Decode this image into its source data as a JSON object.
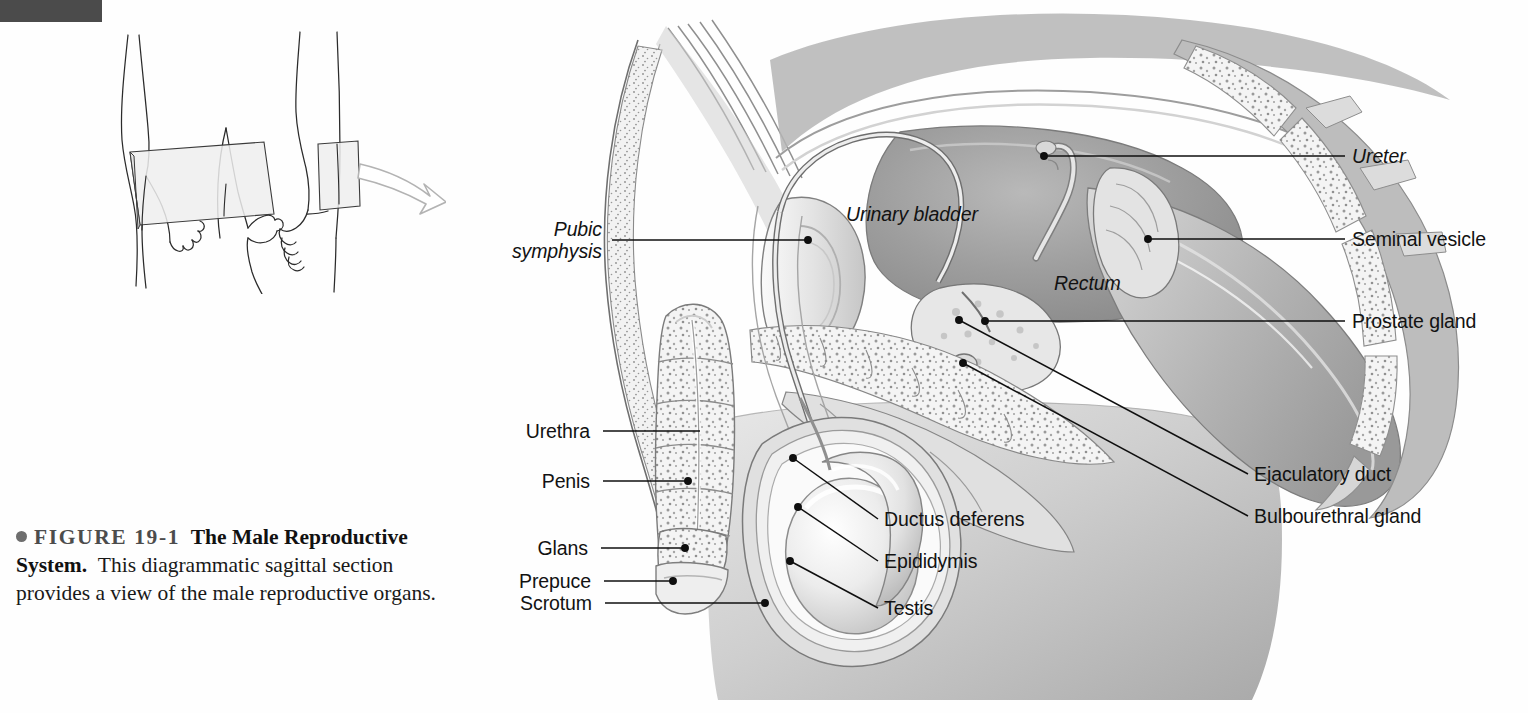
{
  "figure": {
    "tab_color": "#4b4b4b",
    "caption": {
      "bullet": "bullet-icon",
      "figure_number": "FIGURE 19-1",
      "title": "The Male Reproductive System.",
      "body": "This diagrammatic sagittal section provides a view of the male reproductive organs."
    }
  },
  "inset": {
    "name": "orientation-inset",
    "description": "line drawing of a standing figure with sagittal section planes and a curved arrow",
    "arrow_color": "#b0b0b0",
    "plane_fill": "#f0f0f0",
    "line_color": "#2b2b2b"
  },
  "illustration": {
    "name": "male-reproductive-sagittal-section",
    "style": "grayscale medical airbrush illustration"
  },
  "labels": {
    "left": [
      {
        "id": "pubic-symphysis",
        "text": "Pubic",
        "text2": "symphysis",
        "italic": true,
        "x": 518,
        "y": 228,
        "lead_x1": 612,
        "lead_y1": 240,
        "lead_x2": 808,
        "lead_y2": 240
      },
      {
        "id": "urethra",
        "text": "Urethra",
        "italic": false,
        "x": 517,
        "y": 420,
        "lead_x1": 603,
        "lead_y1": 431,
        "lead_x2": 700,
        "lead_y2": 431
      },
      {
        "id": "penis",
        "text": "Penis",
        "italic": false,
        "x": 534,
        "y": 470,
        "lead_x1": 603,
        "lead_y1": 481,
        "lead_x2": 688,
        "lead_y2": 481
      },
      {
        "id": "glans",
        "text": "Glans",
        "italic": false,
        "x": 530,
        "y": 537,
        "lead_x1": 601,
        "lead_y1": 548,
        "lead_x2": 685,
        "lead_y2": 548
      },
      {
        "id": "prepuce",
        "text": "Prepuce",
        "italic": false,
        "x": 512,
        "y": 570,
        "lead_x1": 604,
        "lead_y1": 581,
        "lead_x2": 673,
        "lead_y2": 581
      },
      {
        "id": "scrotum",
        "text": "Scrotum",
        "italic": false,
        "x": 511,
        "y": 592,
        "lead_x1": 605,
        "lead_y1": 603,
        "lead_x2": 765,
        "lead_y2": 603
      }
    ],
    "center": [
      {
        "id": "ductus-deferens",
        "text": "Ductus deferens",
        "italic": false,
        "x": 884,
        "y": 508,
        "lead_x1": 878,
        "lead_y1": 519,
        "lead_x2": 793,
        "lead_y2": 458
      },
      {
        "id": "epididymis",
        "text": "Epididymis",
        "italic": false,
        "x": 884,
        "y": 550,
        "lead_x1": 878,
        "lead_y1": 561,
        "lead_x2": 798,
        "lead_y2": 507
      },
      {
        "id": "testis",
        "text": "Testis",
        "italic": false,
        "x": 884,
        "y": 597,
        "lead_x1": 878,
        "lead_y1": 608,
        "lead_x2": 790,
        "lead_y2": 561
      }
    ],
    "inline": [
      {
        "id": "urinary-bladder",
        "text": "Urinary bladder",
        "italic": true,
        "x": 846,
        "y": 203
      },
      {
        "id": "rectum",
        "text": "Rectum",
        "italic": true,
        "x": 1054,
        "y": 272
      }
    ],
    "right": [
      {
        "id": "ureter",
        "text": "Ureter",
        "italic": true,
        "x": 1352,
        "y": 145,
        "lead_x1": 1345,
        "lead_y1": 156,
        "lead_x2": 1044,
        "lead_y2": 156
      },
      {
        "id": "seminal-vesicle",
        "text": "Seminal vesicle",
        "italic": false,
        "x": 1352,
        "y": 228,
        "lead_x1": 1345,
        "lead_y1": 239,
        "lead_x2": 1148,
        "lead_y2": 239
      },
      {
        "id": "prostate-gland",
        "text": "Prostate gland",
        "italic": false,
        "x": 1352,
        "y": 310,
        "lead_x1": 1345,
        "lead_y1": 321,
        "lead_x2": 985,
        "lead_y2": 321
      },
      {
        "id": "ejaculatory-duct",
        "text": "Ejaculatory duct",
        "italic": false,
        "x": 1254,
        "y": 463,
        "lead_x1": 1248,
        "lead_y1": 474,
        "lead_x2": 959,
        "lead_y2": 320
      },
      {
        "id": "bulbourethral-gland",
        "text": "Bulbourethral gland",
        "italic": false,
        "x": 1254,
        "y": 505,
        "lead_x1": 1248,
        "lead_y1": 516,
        "lead_x2": 963,
        "lead_y2": 363
      }
    ]
  }
}
